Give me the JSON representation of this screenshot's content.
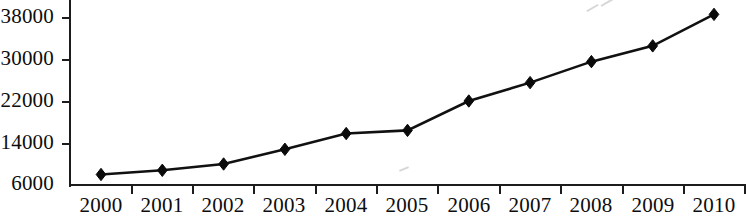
{
  "chart_data": {
    "type": "line",
    "title": "",
    "xlabel": "",
    "ylabel": "",
    "categories": [
      "2000",
      "2001",
      "2002",
      "2003",
      "2004",
      "2005",
      "2006",
      "2007",
      "2008",
      "2009",
      "2010"
    ],
    "values": [
      8000,
      8800,
      10000,
      12800,
      15800,
      16400,
      22000,
      25500,
      29500,
      32500,
      38500
    ],
    "series": [
      {
        "name": "",
        "values": [
          8000,
          8800,
          10000,
          12800,
          15800,
          16400,
          22000,
          25500,
          29500,
          32500,
          38500
        ]
      }
    ],
    "ylim": [
      6000,
      38000
    ],
    "y_ticks": [
      6000,
      14000,
      22000,
      30000,
      38000
    ],
    "y_tick_labels": [
      "6000",
      "14000",
      "22000",
      "30000",
      "38000"
    ],
    "x_tick_labels": [
      "2000",
      "2001",
      "2002",
      "2003",
      "2004",
      "2005",
      "2006",
      "2007",
      "2008",
      "2009",
      "2010"
    ],
    "grid": false,
    "legend": null,
    "marker": "diamond",
    "line_color": "#111111",
    "marker_color": "#0a0a0a",
    "axis_color": "#1c1c1c",
    "background_color": "#ffffff"
  }
}
